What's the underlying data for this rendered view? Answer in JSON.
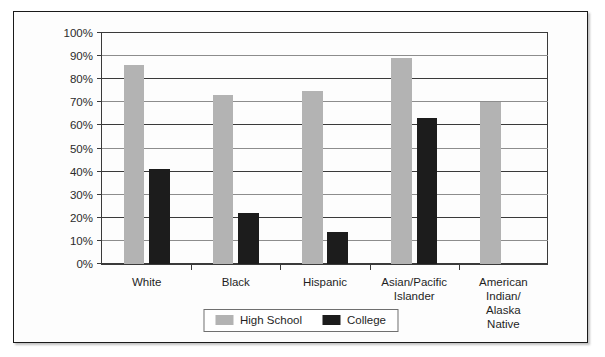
{
  "chart_data": {
    "type": "bar",
    "title": "",
    "xlabel": "",
    "ylabel": "",
    "ylim": [
      0,
      100
    ],
    "grid": true,
    "legend_position": "bottom-center",
    "categories": [
      "White",
      "Black",
      "Hispanic",
      "Asian/Pacific\nIslander",
      "American Indian/\nAlaska Native"
    ],
    "ytick_labels": [
      "100%",
      "90%",
      "80%",
      "70%",
      "60%",
      "50%",
      "40%",
      "30%",
      "20%",
      "10%",
      "0%"
    ],
    "ytick_values": [
      100,
      90,
      80,
      70,
      60,
      50,
      40,
      30,
      20,
      10,
      0
    ],
    "series": [
      {
        "name": "High School",
        "color": "#b3b3b3",
        "values": [
          86,
          73,
          75,
          89,
          70
        ]
      },
      {
        "name": "College",
        "color": "#1c1c1c",
        "values": [
          41,
          22,
          14,
          63,
          null
        ]
      }
    ]
  },
  "legend": {
    "items": [
      {
        "label": "High School",
        "swatch": "hs"
      },
      {
        "label": "College",
        "swatch": "college"
      }
    ]
  }
}
